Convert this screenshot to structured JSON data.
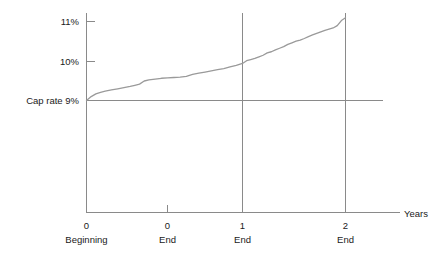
{
  "chart_data": {
    "type": "line",
    "title": "",
    "subtitle": "",
    "xlabel": "Years",
    "ylabel": "",
    "grid": false,
    "legend": null,
    "xlim": [
      0,
      2.35
    ],
    "ylim": [
      8.0,
      11.3
    ],
    "y_ticks": [
      {
        "value": 11,
        "label": "11%"
      },
      {
        "value": 10,
        "label": "10%"
      },
      {
        "value": 9,
        "label": "Cap rate 9%"
      }
    ],
    "x_ticks": [
      {
        "value": 0.0,
        "label": "0",
        "sublabel": "Beginning"
      },
      {
        "value": 0.5,
        "label": "0",
        "sublabel": "End"
      },
      {
        "value": 1.0,
        "label": "1",
        "sublabel": "End"
      },
      {
        "value": 2.0,
        "label": "2",
        "sublabel": "End"
      }
    ],
    "reference_lines": [
      {
        "orientation": "horizontal",
        "value": 9,
        "label": "Cap rate 9%"
      },
      {
        "orientation": "vertical",
        "value": 1.0,
        "label": "End of year 1"
      },
      {
        "orientation": "vertical",
        "value": 2.0,
        "label": "End of year 2"
      }
    ],
    "series": [
      {
        "name": "Yield",
        "x": [
          0.0,
          0.03,
          0.06,
          0.09,
          0.12,
          0.16,
          0.2,
          0.24,
          0.28,
          0.31,
          0.34,
          0.37,
          0.4,
          0.44,
          0.48,
          0.52,
          0.56,
          0.6,
          0.64,
          0.68,
          0.72,
          0.76,
          0.8,
          0.84,
          0.88,
          0.92,
          0.96,
          1.0,
          1.04,
          1.08,
          1.12,
          1.16,
          1.2,
          1.24,
          1.28,
          1.32,
          1.36,
          1.4,
          1.44,
          1.48,
          1.52,
          1.56,
          1.6,
          1.64,
          1.68,
          1.72,
          1.76,
          1.8,
          1.84,
          1.88,
          1.92,
          1.96,
          2.0
        ],
        "y": [
          9.0,
          9.1,
          9.17,
          9.21,
          9.24,
          9.27,
          9.3,
          9.33,
          9.36,
          9.39,
          9.42,
          9.5,
          9.53,
          9.55,
          9.57,
          9.58,
          9.59,
          9.6,
          9.62,
          9.67,
          9.7,
          9.73,
          9.76,
          9.79,
          9.82,
          9.86,
          9.9,
          9.95,
          10.02,
          10.05,
          10.08,
          10.12,
          10.16,
          10.22,
          10.25,
          10.3,
          10.34,
          10.38,
          10.44,
          10.48,
          10.52,
          10.55,
          10.59,
          10.64,
          10.68,
          10.72,
          10.76,
          10.8,
          10.83,
          10.86,
          10.92,
          11.05,
          11.12
        ]
      }
    ]
  },
  "style": {
    "line_color": "#9a9a9a",
    "axis_color": "#8a8a8a",
    "text_color": "#1a1a1a",
    "background": "#ffffff"
  }
}
